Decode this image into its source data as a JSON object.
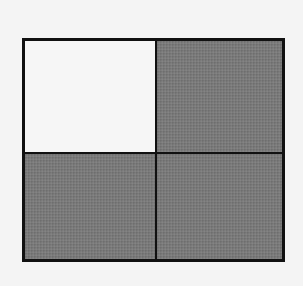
{
  "diagram": {
    "type": "fraction-grid",
    "rows": 2,
    "columns": 2,
    "cells": [
      {
        "position": "top-left",
        "shaded": false
      },
      {
        "position": "top-right",
        "shaded": true
      },
      {
        "position": "bottom-left",
        "shaded": true
      },
      {
        "position": "bottom-right",
        "shaded": true
      }
    ],
    "shaded_count": 3,
    "total_count": 4,
    "colors": {
      "border": "#111111",
      "shaded": "#7a7a7a",
      "unshaded": "#f6f6f6",
      "background": "#f4f4f4"
    }
  }
}
